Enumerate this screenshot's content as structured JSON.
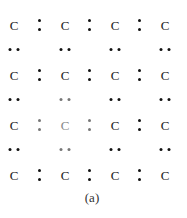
{
  "diagram": {
    "caption": "(a)",
    "atom_label": "C",
    "columns_x": [
      14,
      65,
      115,
      165
    ],
    "bond_columns_x": [
      40,
      90,
      140
    ],
    "atom_rows_y": [
      25,
      75,
      125,
      175
    ],
    "pair_rows_y": [
      50,
      100,
      150
    ],
    "highlighted": {
      "atoms": [
        [
          2,
          1
        ]
      ],
      "colons": [
        [
          2,
          0
        ],
        [
          2,
          1
        ]
      ],
      "pairs": [
        [
          1,
          1
        ],
        [
          2,
          1
        ]
      ]
    },
    "colors": {
      "normal": "#111111",
      "highlight": "#777777"
    }
  }
}
